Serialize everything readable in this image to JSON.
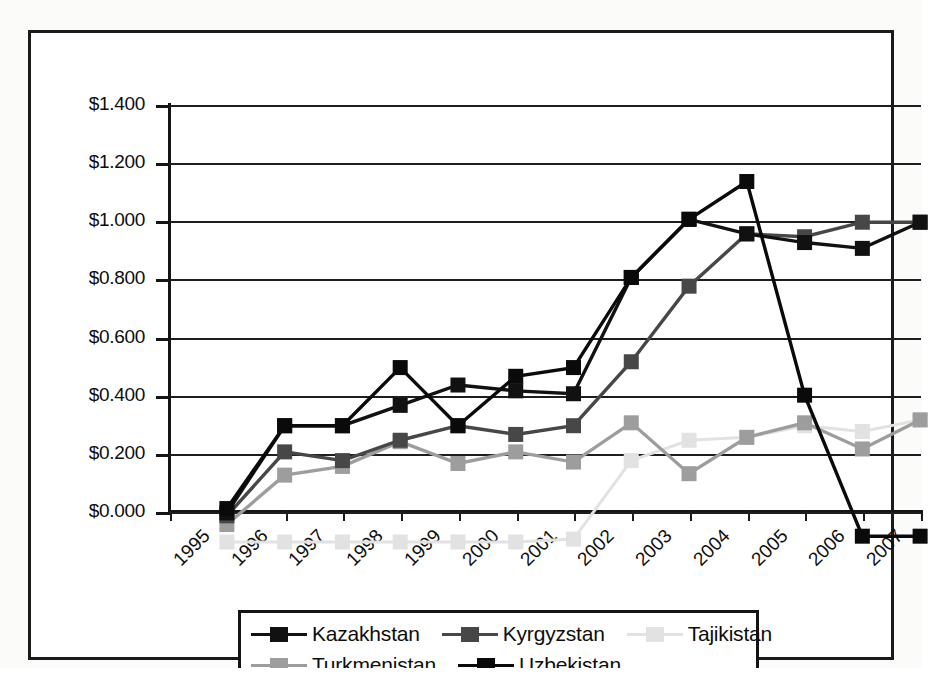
{
  "chart_data": {
    "type": "line",
    "title": "",
    "subtitle": "",
    "xlabel": "",
    "ylabel": "",
    "categories": [
      "1995",
      "1996",
      "1997",
      "1998",
      "1999",
      "2000",
      "2001",
      "2002",
      "2003",
      "2004",
      "2005",
      "2006",
      "2007"
    ],
    "ylim": [
      0.0,
      1.4
    ],
    "ytick_values": [
      0.0,
      0.2,
      0.4,
      0.6,
      0.8,
      1.0,
      1.2,
      1.4
    ],
    "ytick_labels": [
      "$0.000",
      "$0.200",
      "$0.400",
      "$0.600",
      "$0.800",
      "$1.000",
      "$1.200",
      "$1.400"
    ],
    "grid": true,
    "legend_position": "bottom",
    "value_prefix": "$",
    "series": [
      {
        "name": "Kazakhstan",
        "color": "#111111",
        "marker": "square",
        "values": [
          0.1,
          0.4,
          0.4,
          0.47,
          0.54,
          0.52,
          0.51,
          0.91,
          1.11,
          1.06,
          1.03,
          1.01,
          1.1
        ]
      },
      {
        "name": "Kyrgyzstan",
        "color": "#474747",
        "marker": "square",
        "values": [
          0.09,
          0.31,
          0.28,
          0.35,
          0.4,
          0.37,
          0.4,
          0.62,
          0.88,
          1.06,
          1.05,
          1.1,
          1.1
        ]
      },
      {
        "name": "Tajikistan",
        "color": "#e2e2e2",
        "marker": "square",
        "values": [
          0.0,
          0.0,
          0.0,
          0.0,
          0.0,
          0.0,
          0.01,
          0.28,
          0.35,
          0.36,
          0.4,
          0.38,
          0.42
        ]
      },
      {
        "name": "Turkmenistan",
        "color": "#9d9d9d",
        "marker": "square",
        "values": [
          0.06,
          0.23,
          0.26,
          0.345,
          0.27,
          0.31,
          0.275,
          0.41,
          0.235,
          0.36,
          0.41,
          0.32,
          0.42
        ]
      },
      {
        "name": "Uzbekistan",
        "color": "#0a0a0a",
        "marker": "square",
        "values": [
          0.115,
          0.4,
          0.4,
          0.6,
          0.4,
          0.57,
          0.6,
          0.91,
          1.11,
          1.24,
          0.505,
          0.02,
          0.02
        ]
      }
    ]
  },
  "legend": {
    "rows": [
      [
        {
          "label": "Kazakhstan",
          "color": "#111111"
        },
        {
          "label": "Kyrgyzstan",
          "color": "#474747"
        },
        {
          "label": "Tajikistan",
          "color": "#e2e2e2"
        }
      ],
      [
        {
          "label": "Turkmenistan",
          "color": "#9d9d9d"
        },
        {
          "label": "Uzbekistan",
          "color": "#0a0a0a"
        }
      ]
    ]
  }
}
